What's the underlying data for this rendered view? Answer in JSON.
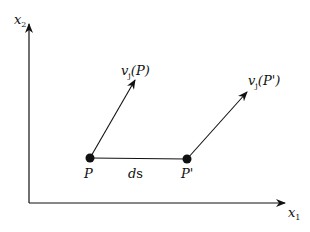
{
  "diagram": {
    "axes": {
      "x_label": "x",
      "x_sub": "1",
      "y_label": "x",
      "y_sub": "2"
    },
    "points": [
      {
        "label": "P"
      },
      {
        "label": "P'"
      }
    ],
    "segment_label": {
      "italic": "d",
      "upright": "s"
    },
    "vectors": [
      {
        "label": "v",
        "sub": "j",
        "arg": "(P)"
      },
      {
        "label": "v",
        "sub": "j",
        "arg": "(P')"
      }
    ],
    "colors": {
      "line": "#111111",
      "background": "#ffffff"
    }
  }
}
